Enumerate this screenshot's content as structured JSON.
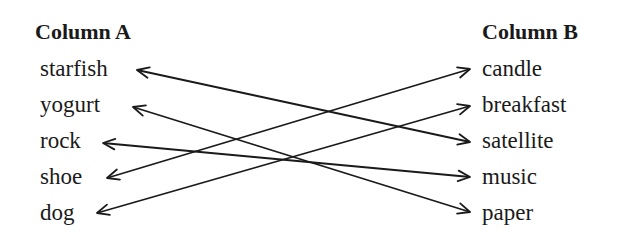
{
  "column_a": {
    "header": "Column A",
    "items": [
      "starfish",
      "yogurt",
      "rock",
      "shoe",
      "dog"
    ]
  },
  "column_b": {
    "header": "Column B",
    "items": [
      "candle",
      "breakfast",
      "satellite",
      "music",
      "paper"
    ]
  },
  "connections": [
    {
      "from": "starfish",
      "to": "satellite",
      "arrows": "both"
    },
    {
      "from": "yogurt",
      "to": "paper",
      "arrows": "both"
    },
    {
      "from": "rock",
      "to": "music",
      "arrows": "both"
    },
    {
      "from": "shoe",
      "to": "candle",
      "arrows": "both"
    },
    {
      "from": "dog",
      "to": "breakfast",
      "arrows": "both"
    }
  ],
  "line_color": "#1a1a1a"
}
